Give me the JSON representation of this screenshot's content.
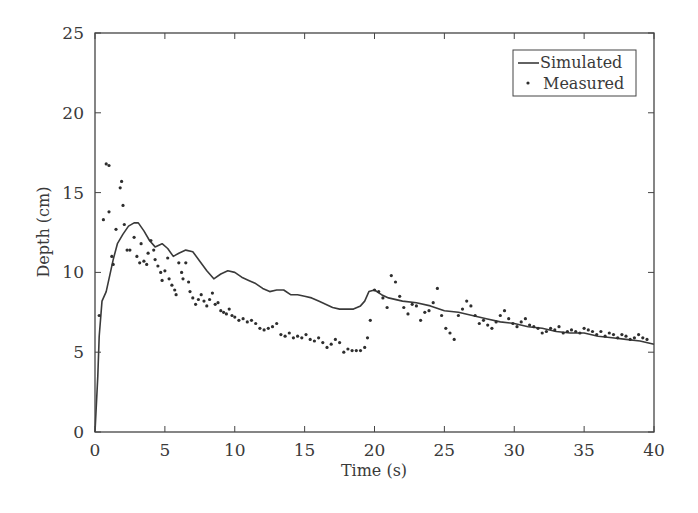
{
  "chart_data": {
    "type": "line",
    "title": "",
    "annotation": "P2",
    "xlabel": "Time (s)",
    "ylabel": "Depth (cm)",
    "xlim": [
      0,
      40
    ],
    "ylim": [
      0,
      25
    ],
    "xticks": [
      0,
      5,
      10,
      15,
      20,
      25,
      30,
      35,
      40
    ],
    "yticks": [
      0,
      5,
      10,
      15,
      20,
      25
    ],
    "grid": false,
    "legend_position": "upper right",
    "legend": [
      "Simulated",
      "Measured"
    ],
    "series": [
      {
        "name": "Simulated",
        "style": "line",
        "x": [
          0,
          0.2,
          0.3,
          0.5,
          0.8,
          1.0,
          1.3,
          1.6,
          2.0,
          2.4,
          2.8,
          3.1,
          3.5,
          3.9,
          4.3,
          4.8,
          5.2,
          5.6,
          6.0,
          6.5,
          7.0,
          7.5,
          8.0,
          8.5,
          9.0,
          9.5,
          10.0,
          10.5,
          11.0,
          11.5,
          12.0,
          12.5,
          13.0,
          13.5,
          14.0,
          14.5,
          15.0,
          15.5,
          16.0,
          16.5,
          17.0,
          17.5,
          18.0,
          18.5,
          19.0,
          19.3,
          19.6,
          20.0,
          20.5,
          21.0,
          22.0,
          23.0,
          24.0,
          25.0,
          26.0,
          27.0,
          28.0,
          29.0,
          30.0,
          31.0,
          32.0,
          33.0,
          34.0,
          35.0,
          36.0,
          37.0,
          38.0,
          39.0,
          40.0
        ],
        "values": [
          0,
          3.5,
          6.0,
          8.2,
          8.8,
          9.6,
          10.8,
          11.8,
          12.4,
          12.9,
          13.1,
          13.1,
          12.6,
          12.0,
          11.6,
          11.8,
          11.5,
          11.0,
          11.2,
          11.4,
          11.3,
          10.7,
          10.1,
          9.6,
          9.9,
          10.1,
          10.0,
          9.7,
          9.5,
          9.3,
          9.0,
          8.8,
          8.9,
          8.9,
          8.6,
          8.6,
          8.5,
          8.4,
          8.2,
          8.0,
          7.8,
          7.7,
          7.7,
          7.7,
          7.9,
          8.2,
          8.8,
          8.9,
          8.6,
          8.4,
          8.2,
          8.1,
          7.9,
          7.6,
          7.5,
          7.3,
          7.1,
          6.9,
          6.8,
          6.6,
          6.5,
          6.3,
          6.2,
          6.2,
          6.0,
          5.9,
          5.8,
          5.7,
          5.5
        ]
      },
      {
        "name": "Measured",
        "style": "dots",
        "x": [
          0.3,
          0.6,
          0.8,
          1.0,
          1.0,
          1.2,
          1.3,
          1.5,
          1.8,
          1.9,
          2.0,
          2.1,
          2.3,
          2.5,
          2.8,
          3.0,
          3.2,
          3.3,
          3.5,
          3.7,
          3.8,
          4.0,
          4.2,
          4.3,
          4.5,
          4.7,
          4.8,
          5.0,
          5.2,
          5.3,
          5.5,
          5.7,
          5.8,
          6.0,
          6.2,
          6.3,
          6.5,
          6.7,
          6.8,
          7.0,
          7.2,
          7.4,
          7.6,
          7.8,
          8.0,
          8.2,
          8.4,
          8.6,
          8.8,
          9.0,
          9.2,
          9.4,
          9.6,
          9.8,
          10.0,
          10.3,
          10.6,
          10.9,
          11.2,
          11.5,
          11.8,
          12.1,
          12.4,
          12.7,
          13.0,
          13.3,
          13.6,
          13.9,
          14.2,
          14.5,
          14.8,
          15.1,
          15.4,
          15.7,
          16.0,
          16.3,
          16.6,
          16.9,
          17.2,
          17.5,
          17.8,
          18.1,
          18.4,
          18.7,
          19.0,
          19.3,
          19.5,
          19.7,
          20.0,
          20.3,
          20.6,
          20.9,
          21.2,
          21.5,
          21.8,
          22.1,
          22.4,
          22.7,
          23.0,
          23.3,
          23.6,
          23.9,
          24.2,
          24.5,
          24.8,
          25.1,
          25.4,
          25.7,
          26.0,
          26.3,
          26.6,
          26.9,
          27.2,
          27.5,
          27.8,
          28.1,
          28.4,
          28.7,
          29.0,
          29.3,
          29.6,
          29.9,
          30.2,
          30.5,
          30.8,
          31.1,
          31.4,
          31.7,
          32.0,
          32.3,
          32.6,
          32.9,
          33.2,
          33.5,
          33.8,
          34.1,
          34.4,
          34.7,
          35.0,
          35.3,
          35.6,
          35.9,
          36.2,
          36.5,
          36.8,
          37.1,
          37.4,
          37.7,
          38.0,
          38.3,
          38.6,
          38.9,
          39.2,
          39.5
        ],
        "values": [
          7.3,
          13.3,
          16.8,
          16.7,
          13.8,
          11.0,
          10.5,
          12.7,
          15.3,
          15.7,
          14.2,
          13.0,
          11.4,
          11.4,
          12.2,
          11.0,
          10.6,
          11.8,
          10.7,
          10.5,
          11.2,
          12.0,
          11.4,
          10.8,
          10.4,
          10.0,
          9.5,
          10.1,
          10.9,
          9.6,
          9.2,
          8.9,
          8.6,
          10.6,
          10.0,
          9.6,
          10.6,
          9.4,
          8.8,
          8.4,
          8.0,
          8.3,
          8.6,
          8.2,
          7.9,
          8.3,
          8.7,
          8.0,
          8.1,
          7.6,
          7.5,
          7.4,
          7.7,
          7.3,
          7.2,
          7.0,
          7.1,
          6.9,
          7.0,
          6.8,
          6.5,
          6.4,
          6.5,
          6.6,
          6.8,
          6.1,
          6.0,
          6.2,
          5.9,
          6.0,
          5.9,
          6.1,
          5.8,
          5.7,
          5.9,
          5.6,
          5.3,
          5.5,
          5.8,
          5.6,
          5.0,
          5.2,
          5.1,
          5.1,
          5.1,
          5.3,
          5.9,
          7.0,
          8.9,
          8.8,
          8.4,
          7.8,
          9.8,
          9.4,
          8.5,
          7.8,
          7.4,
          8.0,
          7.9,
          7.0,
          7.5,
          7.6,
          8.1,
          9.0,
          7.3,
          6.5,
          6.2,
          5.8,
          7.3,
          7.7,
          8.2,
          7.9,
          7.3,
          6.8,
          7.0,
          6.7,
          6.5,
          6.9,
          7.3,
          7.6,
          7.1,
          6.8,
          6.6,
          6.9,
          7.1,
          6.7,
          6.6,
          6.5,
          6.2,
          6.3,
          6.5,
          6.4,
          6.6,
          6.2,
          6.3,
          6.4,
          6.3,
          6.2,
          6.5,
          6.4,
          6.3,
          6.1,
          6.3,
          6.0,
          6.2,
          6.1,
          5.9,
          6.1,
          6.0,
          5.8,
          5.9,
          6.1,
          5.9,
          5.8
        ]
      }
    ]
  },
  "colors": {
    "line": "#3a3a3a",
    "dot": "#2e2e2e",
    "axis": "#444444",
    "background": "#ffffff"
  }
}
